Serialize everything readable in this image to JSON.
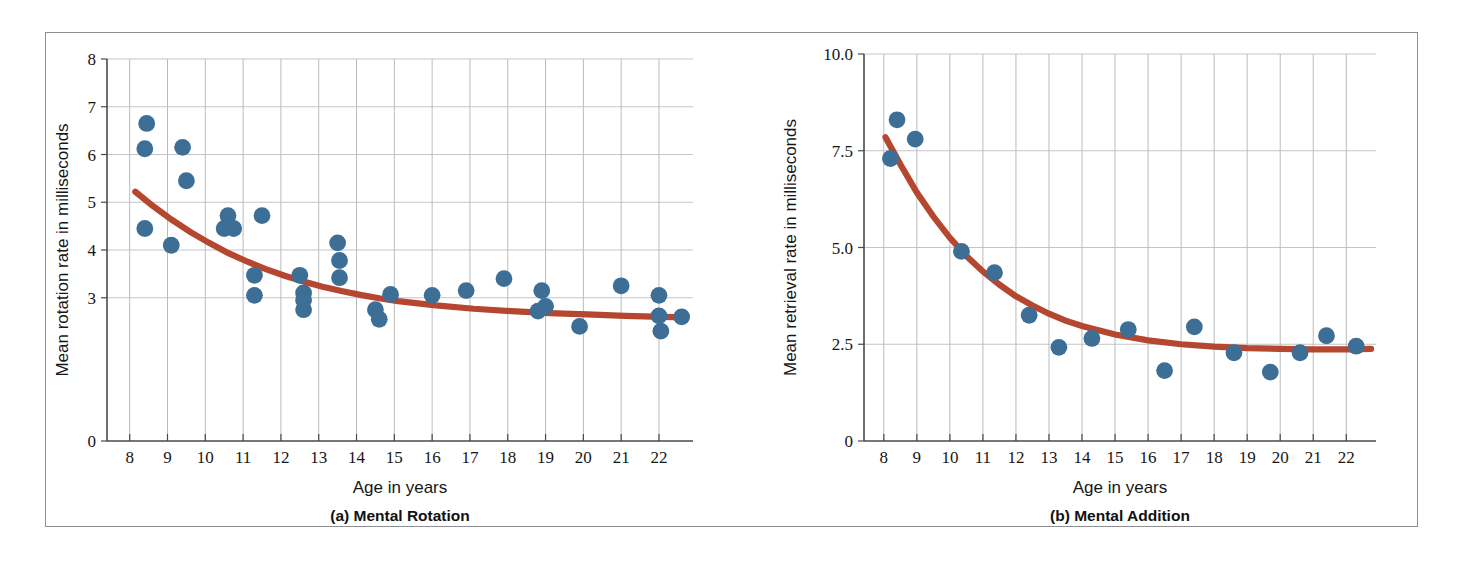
{
  "figure": {
    "background": "#ffffff",
    "frame_color": "#8d8f93",
    "point_color": "#3d6f96",
    "curve_color": "#b5462f",
    "grid_color": "#b9bbbe"
  },
  "chart_data": [
    {
      "type": "scatter",
      "panel_id": "a",
      "title": "(a) Mental Rotation",
      "xlabel": "Age in years",
      "ylabel": "Mean rotation rate in milliseconds",
      "xlim": [
        7.4,
        22.9
      ],
      "ylim": [
        0,
        8
      ],
      "xticks": [
        8,
        9,
        10,
        11,
        12,
        13,
        14,
        15,
        16,
        17,
        18,
        19,
        20,
        21,
        22
      ],
      "yticks": [
        0,
        3,
        4,
        5,
        6,
        7,
        8
      ],
      "ytick_labels": [
        "0",
        "3",
        "4",
        "5",
        "6",
        "7",
        "8"
      ],
      "grid": "both",
      "legend": "none",
      "points": [
        {
          "x": 8.45,
          "y": 6.65
        },
        {
          "x": 8.4,
          "y": 6.12
        },
        {
          "x": 9.4,
          "y": 6.15
        },
        {
          "x": 9.5,
          "y": 5.45
        },
        {
          "x": 8.4,
          "y": 4.45
        },
        {
          "x": 9.1,
          "y": 4.1
        },
        {
          "x": 10.5,
          "y": 4.45
        },
        {
          "x": 10.6,
          "y": 4.72
        },
        {
          "x": 10.75,
          "y": 4.45
        },
        {
          "x": 11.5,
          "y": 4.72
        },
        {
          "x": 11.3,
          "y": 3.47
        },
        {
          "x": 11.3,
          "y": 3.05
        },
        {
          "x": 12.5,
          "y": 3.47
        },
        {
          "x": 12.6,
          "y": 3.1
        },
        {
          "x": 12.6,
          "y": 2.95
        },
        {
          "x": 12.6,
          "y": 2.75
        },
        {
          "x": 13.5,
          "y": 4.15
        },
        {
          "x": 13.55,
          "y": 3.78
        },
        {
          "x": 13.55,
          "y": 3.42
        },
        {
          "x": 14.5,
          "y": 2.75
        },
        {
          "x": 14.6,
          "y": 2.55
        },
        {
          "x": 14.9,
          "y": 3.07
        },
        {
          "x": 16.0,
          "y": 3.05
        },
        {
          "x": 16.9,
          "y": 3.15
        },
        {
          "x": 17.9,
          "y": 3.4
        },
        {
          "x": 18.9,
          "y": 3.15
        },
        {
          "x": 18.8,
          "y": 2.72
        },
        {
          "x": 19.0,
          "y": 2.82
        },
        {
          "x": 19.9,
          "y": 2.4
        },
        {
          "x": 21.0,
          "y": 3.25
        },
        {
          "x": 22.0,
          "y": 3.05
        },
        {
          "x": 22.0,
          "y": 2.62
        },
        {
          "x": 22.05,
          "y": 2.3
        },
        {
          "x": 22.6,
          "y": 2.6
        }
      ],
      "fit_curve": {
        "description": "decaying exponential trend line",
        "x": [
          8.15,
          8.6,
          9.1,
          9.6,
          10.1,
          10.6,
          11.1,
          11.6,
          12.1,
          12.6,
          13.1,
          13.6,
          14.1,
          14.6,
          15.1,
          16.1,
          17.1,
          18.1,
          19.1,
          20.1,
          21.1,
          22.1,
          22.7
        ],
        "y": [
          5.22,
          4.93,
          4.64,
          4.38,
          4.15,
          3.94,
          3.76,
          3.6,
          3.46,
          3.34,
          3.23,
          3.14,
          3.06,
          2.99,
          2.93,
          2.84,
          2.77,
          2.72,
          2.68,
          2.65,
          2.62,
          2.6,
          2.59
        ]
      }
    },
    {
      "type": "scatter",
      "panel_id": "b",
      "title": "(b) Mental Addition",
      "xlabel": "Age in years",
      "ylabel": "Mean retrieval rate in milliseconds",
      "xlim": [
        7.4,
        22.9
      ],
      "ylim": [
        0,
        10
      ],
      "xticks": [
        8,
        9,
        10,
        11,
        12,
        13,
        14,
        15,
        16,
        17,
        18,
        19,
        20,
        21,
        22
      ],
      "yticks": [
        0,
        2.5,
        5.0,
        7.5,
        10.0
      ],
      "ytick_labels": [
        "0",
        "2.5",
        "5.0",
        "7.5",
        "10.0"
      ],
      "grid": "both",
      "legend": "none",
      "points": [
        {
          "x": 8.4,
          "y": 8.3
        },
        {
          "x": 8.2,
          "y": 7.3
        },
        {
          "x": 8.95,
          "y": 7.8
        },
        {
          "x": 10.35,
          "y": 4.9
        },
        {
          "x": 11.35,
          "y": 4.35
        },
        {
          "x": 12.4,
          "y": 3.25
        },
        {
          "x": 13.3,
          "y": 2.42
        },
        {
          "x": 14.3,
          "y": 2.65
        },
        {
          "x": 15.4,
          "y": 2.88
        },
        {
          "x": 16.5,
          "y": 1.82
        },
        {
          "x": 17.4,
          "y": 2.95
        },
        {
          "x": 18.6,
          "y": 2.28
        },
        {
          "x": 19.7,
          "y": 1.78
        },
        {
          "x": 20.6,
          "y": 2.28
        },
        {
          "x": 21.4,
          "y": 2.72
        },
        {
          "x": 22.3,
          "y": 2.45
        }
      ],
      "fit_curve": {
        "description": "decaying exponential trend line",
        "x": [
          8.05,
          8.5,
          9.0,
          9.5,
          10.0,
          10.5,
          11.0,
          11.5,
          12.0,
          12.5,
          13.0,
          13.5,
          14.0,
          15.0,
          16.0,
          17.0,
          18.0,
          19.0,
          20.0,
          21.0,
          22.0,
          22.75
        ],
        "y": [
          7.85,
          7.15,
          6.42,
          5.8,
          5.25,
          4.78,
          4.38,
          4.04,
          3.74,
          3.5,
          3.29,
          3.11,
          2.97,
          2.75,
          2.6,
          2.5,
          2.44,
          2.4,
          2.38,
          2.37,
          2.37,
          2.38
        ]
      }
    }
  ]
}
